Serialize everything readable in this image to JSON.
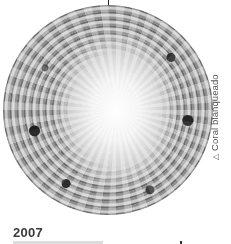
{
  "figure": {
    "image_description": "Circular photo of bleached coral",
    "caption_icon": "triangle-icon",
    "caption_glyph": "△",
    "caption": "Coral blanqueado",
    "year": "2007"
  },
  "colors": {
    "text": "#3a3a3a",
    "caption_text": "#555555",
    "background": "#ffffff"
  }
}
